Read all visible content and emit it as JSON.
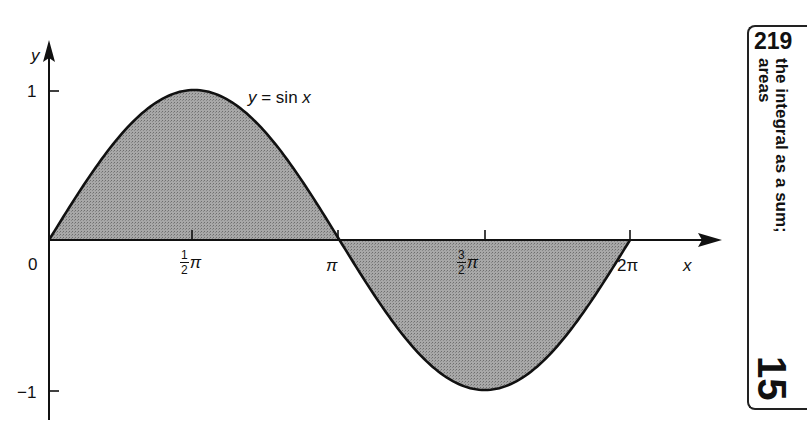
{
  "chart_data": {
    "type": "area",
    "title": "",
    "function_label": "y = sin x",
    "xlabel": "x",
    "ylabel": "y",
    "origin_label": "0",
    "x_ticks": [
      {
        "value": 1.5708,
        "label": "½π",
        "num": "1",
        "den": "2"
      },
      {
        "value": 3.1416,
        "label": "π"
      },
      {
        "value": 4.7124,
        "label": "3/2π",
        "num": "3",
        "den": "2"
      },
      {
        "value": 6.2832,
        "label": "2π"
      }
    ],
    "y_ticks": [
      {
        "value": 1,
        "label": "1"
      },
      {
        "value": -1,
        "label": "−1"
      }
    ],
    "xlim": [
      0,
      6.2832
    ],
    "ylim": [
      -1,
      1
    ],
    "series": [
      {
        "name": "y = sin x",
        "x": [
          0,
          0.7854,
          1.5708,
          2.3562,
          3.1416,
          3.927,
          4.7124,
          5.4978,
          6.2832
        ],
        "values": [
          0,
          0.707,
          1,
          0.707,
          0,
          -0.707,
          -1,
          -0.707,
          0
        ]
      }
    ],
    "shaded_region": "area between y = sin x and the x-axis from 0 to 2π",
    "grid": false,
    "legend": false,
    "colors": {
      "fill": "#9a9a9a",
      "stroke": "#111111"
    }
  },
  "labels": {
    "y_axis": "y",
    "x_axis": "x",
    "origin": "0",
    "y_one": "1",
    "y_minus_one": "−1",
    "tick_half_pi_num": "1",
    "tick_half_pi_den": "2",
    "tick_pi": "π",
    "tick_three_half_pi_num": "3",
    "tick_three_half_pi_den": "2",
    "tick_two_pi": "2π",
    "pi_symbol": "π",
    "curve_label_y": "y",
    "curve_label_rest": " = sin ",
    "curve_label_x": "x"
  },
  "margin_tab": {
    "page_number": "219",
    "title_line1": "the integral as a sum;",
    "title_line2": "areas",
    "chapter_number": "15"
  }
}
